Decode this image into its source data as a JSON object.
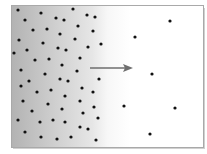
{
  "diagram": {
    "type": "diffusion-concentration-gradient",
    "frame": {
      "x": 11,
      "y": 5,
      "width": 191,
      "height": 141,
      "border_color": "#a9a9a9"
    },
    "gradient": {
      "high_color": "#b3b3b3",
      "low_color": "#ffffff"
    },
    "arrow": {
      "x1": 90,
      "y1": 68,
      "x2": 133,
      "y2": 68,
      "color": "#6e6e6e",
      "direction": "right"
    },
    "particle_color": "#111111",
    "particle_radius": 1.6,
    "particles_high_concentration": [
      [
        18,
        10
      ],
      [
        41,
        13
      ],
      [
        73,
        9
      ],
      [
        87,
        15
      ],
      [
        95,
        17
      ],
      [
        25,
        20
      ],
      [
        56,
        18
      ],
      [
        64,
        20
      ],
      [
        33,
        30
      ],
      [
        47,
        29
      ],
      [
        78,
        26
      ],
      [
        93,
        31
      ],
      [
        60,
        34
      ],
      [
        75,
        39
      ],
      [
        19,
        40
      ],
      [
        43,
        43
      ],
      [
        101,
        44
      ],
      [
        88,
        47
      ],
      [
        14,
        53
      ],
      [
        27,
        50
      ],
      [
        58,
        48
      ],
      [
        66,
        50
      ],
      [
        35,
        60
      ],
      [
        49,
        59
      ],
      [
        80,
        58
      ],
      [
        62,
        65
      ],
      [
        21,
        70
      ],
      [
        77,
        71
      ],
      [
        45,
        74
      ],
      [
        99,
        79
      ],
      [
        60,
        79
      ],
      [
        68,
        81
      ],
      [
        29,
        81
      ],
      [
        21,
        86
      ],
      [
        82,
        88
      ],
      [
        37,
        92
      ],
      [
        51,
        90
      ],
      [
        93,
        92
      ],
      [
        65,
        96
      ],
      [
        23,
        101
      ],
      [
        80,
        101
      ],
      [
        48,
        104
      ],
      [
        94,
        107
      ],
      [
        32,
        111
      ],
      [
        62,
        109
      ],
      [
        83,
        113
      ],
      [
        18,
        120
      ],
      [
        40,
        122
      ],
      [
        53,
        120
      ],
      [
        65,
        122
      ],
      [
        98,
        118
      ],
      [
        25,
        132
      ],
      [
        80,
        127
      ],
      [
        88,
        129
      ],
      [
        41,
        137
      ],
      [
        57,
        139
      ],
      [
        71,
        137
      ],
      [
        96,
        140
      ]
    ],
    "particles_low_concentration": [
      [
        170,
        21
      ],
      [
        135,
        37
      ],
      [
        152,
        74
      ],
      [
        124,
        106
      ],
      [
        175,
        108
      ],
      [
        150,
        134
      ]
    ]
  }
}
